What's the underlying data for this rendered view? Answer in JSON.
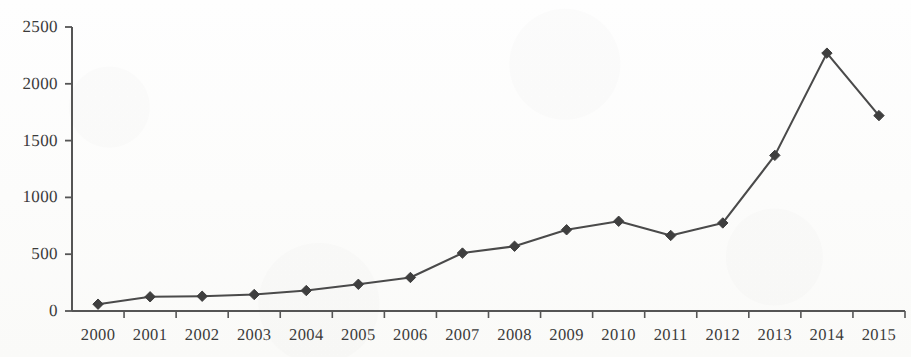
{
  "figure": {
    "background_color": "#fdfdfc",
    "line_color": "#4a4a4a",
    "marker_color": "#3f3f3f",
    "axis_color": "#555555",
    "text_color": "#3b3b3b"
  },
  "axes": {
    "y_ticks": [
      "0",
      "500",
      "1000",
      "1500",
      "2000",
      "2500"
    ],
    "x_ticks": [
      "2000",
      "2001",
      "2002",
      "2003",
      "2004",
      "2005",
      "2006",
      "2007",
      "2008",
      "2009",
      "2010",
      "2011",
      "2012",
      "2013",
      "2014",
      "2015"
    ]
  },
  "chart_data": {
    "type": "line",
    "title": "",
    "xlabel": "",
    "ylabel": "",
    "categories": [
      "2000",
      "2001",
      "2002",
      "2003",
      "2004",
      "2005",
      "2006",
      "2007",
      "2008",
      "2009",
      "2010",
      "2011",
      "2012",
      "2013",
      "2014",
      "2015"
    ],
    "values": [
      60,
      125,
      130,
      145,
      180,
      235,
      295,
      510,
      570,
      715,
      790,
      665,
      775,
      1370,
      2270,
      1720
    ],
    "series": [
      {
        "name": "series-1",
        "values": [
          60,
          125,
          130,
          145,
          180,
          235,
          295,
          510,
          570,
          715,
          790,
          665,
          775,
          1370,
          2270,
          1720
        ],
        "color": "#4a4a4a",
        "marker": "diamond"
      }
    ],
    "ylim": [
      0,
      2500
    ],
    "yticks": [
      0,
      500,
      1000,
      1500,
      2000,
      2500
    ],
    "grid": false,
    "legend": null,
    "legend_position": "none"
  }
}
